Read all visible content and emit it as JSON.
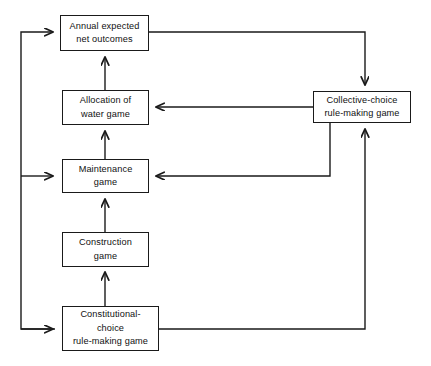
{
  "diagram": {
    "background_color": "#ffffff",
    "line_color": "#1a1a1a",
    "text_color": "#111111",
    "nodes": [
      {
        "id": "annual-expected-net-outcomes",
        "lines": [
          "Annual expected",
          "net outcomes"
        ],
        "x": 60,
        "y": 15,
        "w": 89,
        "h": 36
      },
      {
        "id": "allocation-of-water-game",
        "lines": [
          "Allocation of",
          "water game"
        ],
        "x": 62,
        "y": 90,
        "w": 87,
        "h": 35
      },
      {
        "id": "maintenance-game",
        "lines": [
          "Maintenance",
          "game"
        ],
        "x": 62,
        "y": 159,
        "w": 87,
        "h": 34
      },
      {
        "id": "construction-game",
        "lines": [
          "Construction",
          "game"
        ],
        "x": 62,
        "y": 232,
        "w": 87,
        "h": 35
      },
      {
        "id": "constitutional-choice-rule-making-game",
        "lines": [
          "Constitutional-",
          "choice",
          "rule-making game"
        ],
        "x": 62,
        "y": 306,
        "w": 97,
        "h": 45
      },
      {
        "id": "collective-choice-rule-making-game",
        "lines": [
          "Collective-choice",
          "rule-making game"
        ],
        "x": 313,
        "y": 91,
        "w": 98,
        "h": 32
      }
    ],
    "edges": [
      {
        "id": "edge-allocation-to-annual",
        "from": "allocation-of-water-game",
        "to": "annual-expected-net-outcomes"
      },
      {
        "id": "edge-maintenance-to-allocation",
        "from": "maintenance-game",
        "to": "allocation-of-water-game"
      },
      {
        "id": "edge-construction-to-maintenance",
        "from": "construction-game",
        "to": "maintenance-game"
      },
      {
        "id": "edge-constitutional-to-construction",
        "from": "constitutional-choice-rule-making-game",
        "to": "construction-game"
      },
      {
        "id": "edge-annual-to-collective",
        "from": "annual-expected-net-outcomes",
        "to": "collective-choice-rule-making-game"
      },
      {
        "id": "edge-collective-to-allocation",
        "from": "collective-choice-rule-making-game",
        "to": "allocation-of-water-game"
      },
      {
        "id": "edge-collective-to-maintenance",
        "from": "collective-choice-rule-making-game",
        "to": "maintenance-game"
      },
      {
        "id": "edge-constitutional-to-collective",
        "from": "constitutional-choice-rule-making-game",
        "to": "collective-choice-rule-making-game"
      },
      {
        "id": "edge-feedback-to-annual",
        "from": "constitutional-choice-rule-making-game",
        "to": "annual-expected-net-outcomes"
      },
      {
        "id": "edge-feedback-to-maintenance",
        "from": "constitutional-choice-rule-making-game",
        "to": "maintenance-game"
      },
      {
        "id": "edge-feedback-to-constitutional",
        "from": "constitutional-choice-rule-making-game",
        "to": "constitutional-choice-rule-making-game"
      }
    ]
  }
}
